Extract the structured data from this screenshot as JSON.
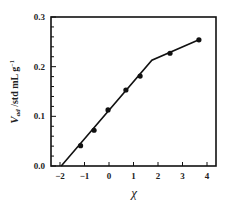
{
  "chart_data": {
    "type": "scatter",
    "title": "",
    "xlabel": "χ",
    "ylabel": "V_ad /std mL g⁻¹",
    "ylabel_parts": {
      "main": "V",
      "sub": "ad",
      "rest": " /std mL g",
      "sup": "−1"
    },
    "xlim": [
      -2.45,
      4.4
    ],
    "ylim": [
      0.0,
      0.3
    ],
    "x_ticks": [
      -2,
      -1,
      0,
      1,
      2,
      3,
      4
    ],
    "x_tick_labels": [
      "−2",
      "−1",
      "0",
      "1",
      "2",
      "3",
      "4"
    ],
    "y_ticks": [
      0.0,
      0.1,
      0.2,
      0.3
    ],
    "y_tick_labels": [
      "0.0",
      "0.1",
      "0.2",
      "0.3"
    ],
    "y_minor_step": 0.02,
    "grid": false,
    "legend": null,
    "series": [
      {
        "name": "data",
        "type": "scatter",
        "marker": "circle",
        "color": "#111111",
        "x": [
          -1.16,
          -0.61,
          -0.04,
          0.69,
          1.27,
          2.49,
          3.67
        ],
        "y": [
          0.041,
          0.072,
          0.113,
          0.153,
          0.181,
          0.227,
          0.254
        ]
      },
      {
        "name": "fit",
        "type": "line",
        "color": "#111111",
        "x": [
          -1.95,
          1.75,
          3.67
        ],
        "y": [
          0.0,
          0.213,
          0.254
        ]
      }
    ]
  }
}
